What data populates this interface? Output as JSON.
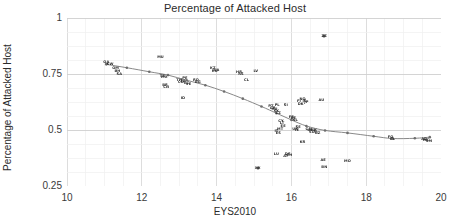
{
  "chart_data": {
    "type": "scatter",
    "title": "Percentage of Attacked Host",
    "xlabel": "EYS2010",
    "ylabel": "Percentage of Attacked Host",
    "xlim": [
      10,
      20
    ],
    "ylim": [
      0.25,
      1
    ],
    "xticks": [
      10,
      12,
      14,
      16,
      18,
      20
    ],
    "xtick_labels": [
      "10",
      "12",
      "14",
      "16",
      "18",
      "20"
    ],
    "yticks": [
      0.25,
      0.5,
      0.75,
      1
    ],
    "ytick_labels": [
      "0.25",
      "0.5",
      "0.75",
      "1"
    ],
    "grid": true,
    "grid_minor_x_step": 0.5,
    "grid_minor_y_step": 0.0625,
    "legend": "none",
    "marker_style": "small-dark-text-labels",
    "points": [
      {
        "x": 11.05,
        "y": 0.805,
        "label": "QA"
      },
      {
        "x": 11.15,
        "y": 0.795,
        "label": "KW"
      },
      {
        "x": 11.3,
        "y": 0.775,
        "label": "OM"
      },
      {
        "x": 11.35,
        "y": 0.765,
        "label": "BH"
      },
      {
        "x": 11.4,
        "y": 0.752,
        "label": "SA"
      },
      {
        "x": 12.5,
        "y": 0.825,
        "label": "MU"
      },
      {
        "x": 12.55,
        "y": 0.742,
        "label": "TR"
      },
      {
        "x": 12.6,
        "y": 0.735,
        "label": "MX"
      },
      {
        "x": 12.62,
        "y": 0.7,
        "label": "BR"
      },
      {
        "x": 12.65,
        "y": 0.69,
        "label": "CN"
      },
      {
        "x": 13.0,
        "y": 0.722,
        "label": "TH"
      },
      {
        "x": 13.05,
        "y": 0.715,
        "label": "CO"
      },
      {
        "x": 13.1,
        "y": 0.718,
        "label": "ZA"
      },
      {
        "x": 13.15,
        "y": 0.73,
        "label": "PE"
      },
      {
        "x": 13.2,
        "y": 0.712,
        "label": "EC"
      },
      {
        "x": 13.25,
        "y": 0.705,
        "label": "VE"
      },
      {
        "x": 13.1,
        "y": 0.645,
        "label": "ID"
      },
      {
        "x": 13.45,
        "y": 0.722,
        "label": "RO"
      },
      {
        "x": 13.5,
        "y": 0.715,
        "label": "BG"
      },
      {
        "x": 13.9,
        "y": 0.775,
        "label": "KZ"
      },
      {
        "x": 13.95,
        "y": 0.762,
        "label": "RU"
      },
      {
        "x": 14.0,
        "y": 0.77,
        "label": "UA"
      },
      {
        "x": 14.6,
        "y": 0.76,
        "label": "HR"
      },
      {
        "x": 14.65,
        "y": 0.752,
        "label": "RS"
      },
      {
        "x": 14.8,
        "y": 0.722,
        "label": "CL"
      },
      {
        "x": 15.05,
        "y": 0.765,
        "label": "LV"
      },
      {
        "x": 15.1,
        "y": 0.33,
        "label": "XX"
      },
      {
        "x": 15.45,
        "y": 0.605,
        "label": "PT"
      },
      {
        "x": 15.5,
        "y": 0.598,
        "label": "GR"
      },
      {
        "x": 15.55,
        "y": 0.592,
        "label": "HU"
      },
      {
        "x": 15.6,
        "y": 0.585,
        "label": "SK"
      },
      {
        "x": 15.62,
        "y": 0.612,
        "label": "PL"
      },
      {
        "x": 15.65,
        "y": 0.575,
        "label": "CZ"
      },
      {
        "x": 15.6,
        "y": 0.495,
        "label": "IT"
      },
      {
        "x": 15.65,
        "y": 0.485,
        "label": "ES"
      },
      {
        "x": 15.7,
        "y": 0.505,
        "label": "MT"
      },
      {
        "x": 15.72,
        "y": 0.54,
        "label": "CY"
      },
      {
        "x": 15.75,
        "y": 0.53,
        "label": "LT"
      },
      {
        "x": 15.78,
        "y": 0.52,
        "label": "EE"
      },
      {
        "x": 15.6,
        "y": 0.395,
        "label": "LU"
      },
      {
        "x": 15.85,
        "y": 0.385,
        "label": "AT"
      },
      {
        "x": 15.9,
        "y": 0.392,
        "label": "DE"
      },
      {
        "x": 15.95,
        "y": 0.388,
        "label": "CH"
      },
      {
        "x": 15.85,
        "y": 0.61,
        "label": "SI"
      },
      {
        "x": 16.0,
        "y": 0.56,
        "label": "FR"
      },
      {
        "x": 16.05,
        "y": 0.552,
        "label": "BE"
      },
      {
        "x": 16.1,
        "y": 0.545,
        "label": "NL"
      },
      {
        "x": 16.1,
        "y": 0.505,
        "label": "UK"
      },
      {
        "x": 16.15,
        "y": 0.498,
        "label": "IE"
      },
      {
        "x": 16.18,
        "y": 0.512,
        "label": "SE"
      },
      {
        "x": 16.2,
        "y": 0.628,
        "label": "FI"
      },
      {
        "x": 16.25,
        "y": 0.618,
        "label": "DK"
      },
      {
        "x": 16.3,
        "y": 0.64,
        "label": "NO"
      },
      {
        "x": 16.35,
        "y": 0.63,
        "label": "IS"
      },
      {
        "x": 16.4,
        "y": 0.625,
        "label": "JP"
      },
      {
        "x": 16.3,
        "y": 0.448,
        "label": "KR"
      },
      {
        "x": 16.45,
        "y": 0.505,
        "label": "CA"
      },
      {
        "x": 16.5,
        "y": 0.498,
        "label": "US"
      },
      {
        "x": 16.55,
        "y": 0.49,
        "label": "SG"
      },
      {
        "x": 16.6,
        "y": 0.502,
        "label": "HK"
      },
      {
        "x": 16.65,
        "y": 0.495,
        "label": "IL"
      },
      {
        "x": 16.7,
        "y": 0.488,
        "label": "NZ"
      },
      {
        "x": 16.8,
        "y": 0.632,
        "label": "AU"
      },
      {
        "x": 16.88,
        "y": 0.92,
        "label": "ZZ"
      },
      {
        "x": 16.85,
        "y": 0.365,
        "label": "AE"
      },
      {
        "x": 16.88,
        "y": 0.335,
        "label": "BN"
      },
      {
        "x": 17.5,
        "y": 0.362,
        "label": "MO"
      },
      {
        "x": 18.65,
        "y": 0.47,
        "label": "FO"
      },
      {
        "x": 18.7,
        "y": 0.462,
        "label": "GL"
      },
      {
        "x": 19.55,
        "y": 0.462,
        "label": "AD"
      },
      {
        "x": 19.6,
        "y": 0.455,
        "label": "MC"
      },
      {
        "x": 19.68,
        "y": 0.45,
        "label": "SM"
      }
    ],
    "trend_line": {
      "name": "smoothed fit",
      "color": "#7a7a7a",
      "x": [
        11.05,
        11.6,
        12.2,
        12.7,
        13.2,
        13.7,
        14.2,
        14.7,
        15.2,
        15.6,
        16.0,
        16.4,
        16.9,
        17.5,
        18.2,
        18.7,
        19.3,
        19.7
      ],
      "y": [
        0.793,
        0.778,
        0.76,
        0.745,
        0.722,
        0.7,
        0.672,
        0.64,
        0.605,
        0.575,
        0.545,
        0.518,
        0.498,
        0.487,
        0.472,
        0.462,
        0.463,
        0.468
      ]
    }
  }
}
